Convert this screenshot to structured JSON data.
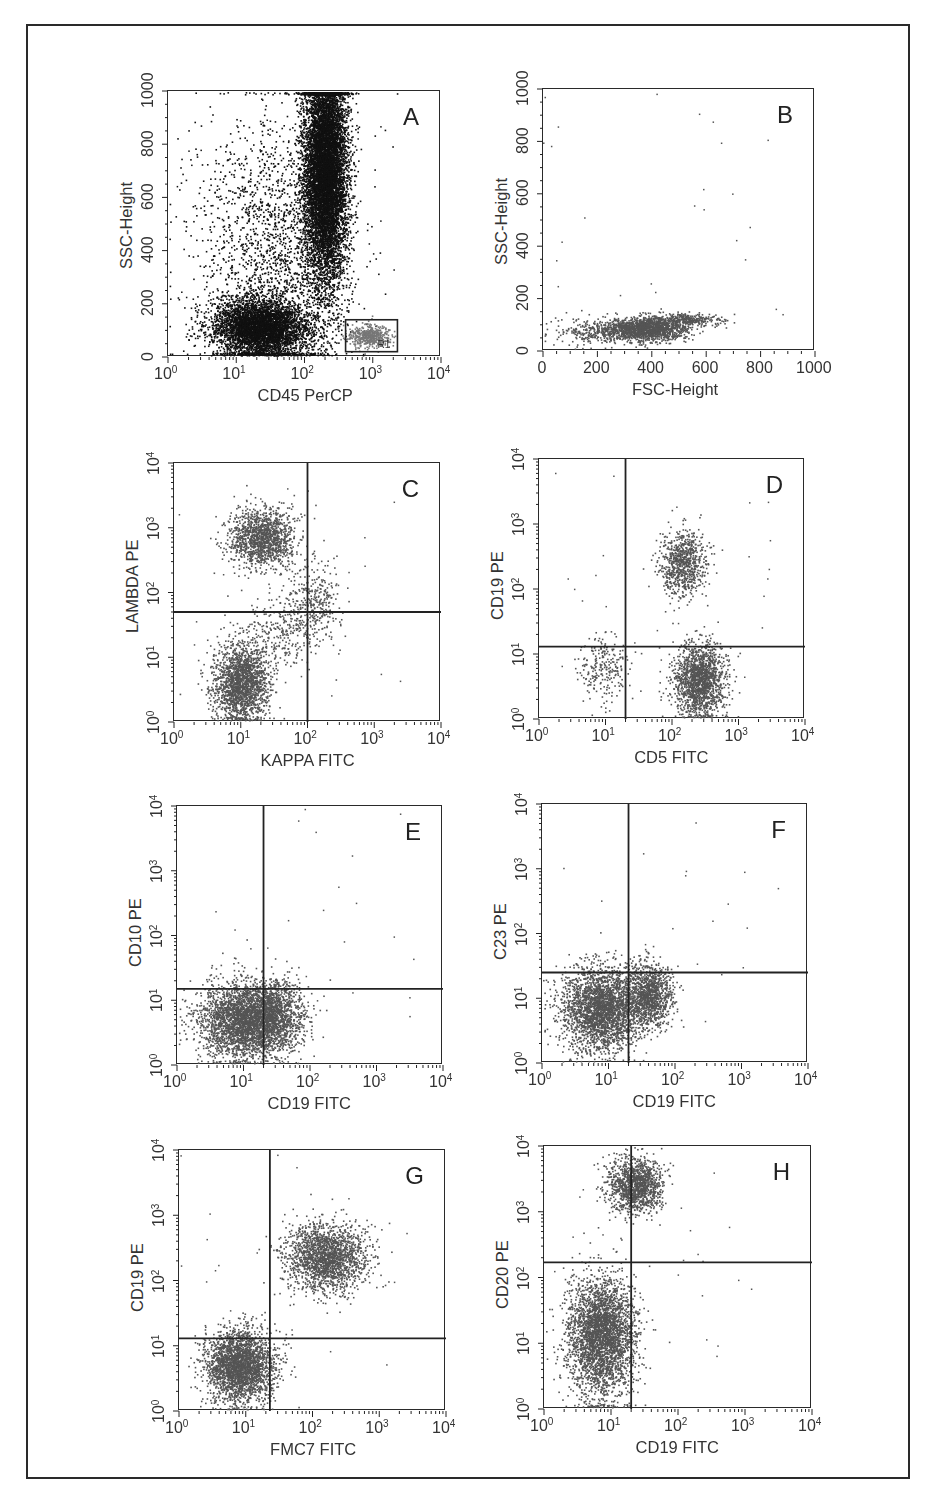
{
  "chart_data": [
    {
      "panel": "A",
      "type": "scatter",
      "xlabel": "CD45 PerCP",
      "ylabel": "SSC-Height",
      "xscale": "log",
      "xlim": [
        1,
        10000
      ],
      "xticks": [
        "10^0",
        "10^1",
        "10^2",
        "10^3",
        "10^4"
      ],
      "yscale": "linear",
      "ylim": [
        0,
        1000
      ],
      "yticks": [
        "0",
        "200",
        "400",
        "600",
        "800",
        "1000"
      ],
      "color": "#111111",
      "gate_box": {
        "label": "R1",
        "x": [
          400,
          2300
        ],
        "y": [
          20,
          140
        ]
      },
      "clusters": [
        {
          "name": "granulocytes",
          "x_log_center": 2.3,
          "x_log_sd": 0.16,
          "y_center": 700,
          "y_sd": 220,
          "n": 9000
        },
        {
          "name": "lymph/debris",
          "x_log_center": 1.35,
          "x_log_sd": 0.35,
          "y_center": 110,
          "y_sd": 55,
          "n": 4500
        },
        {
          "name": "scatter",
          "x_log_center": 1.5,
          "x_log_sd": 0.55,
          "y_center": 400,
          "y_sd": 260,
          "n": 1800
        },
        {
          "name": "R1 lymphocytes",
          "x_log_center": 2.95,
          "x_log_sd": 0.15,
          "y_center": 80,
          "y_sd": 20,
          "n": 500,
          "gray": true
        }
      ]
    },
    {
      "panel": "B",
      "type": "scatter",
      "xlabel": "FSC-Height",
      "ylabel": "SSC-Height",
      "xscale": "linear",
      "xlim": [
        0,
        1000
      ],
      "xticks": [
        "0",
        "200",
        "400",
        "600",
        "800",
        "1000"
      ],
      "yscale": "linear",
      "ylim": [
        0,
        1000
      ],
      "yticks": [
        "0",
        "200",
        "400",
        "600",
        "800",
        "1000"
      ],
      "color": "#555555",
      "clusters": [
        {
          "x_center": 380,
          "x_sd": 70,
          "y_center": 85,
          "y_sd": 22,
          "n": 1600
        },
        {
          "x_center": 520,
          "x_sd": 60,
          "y_center": 120,
          "y_sd": 12,
          "n": 350
        },
        {
          "x_center": 180,
          "x_sd": 70,
          "y_center": 75,
          "y_sd": 25,
          "n": 300
        }
      ]
    },
    {
      "panel": "C",
      "type": "scatter",
      "xlabel": "KAPPA FITC",
      "ylabel": "LAMBDA PE",
      "xscale": "log",
      "xlim": [
        1,
        10000
      ],
      "yscale": "log",
      "ylim": [
        1,
        10000
      ],
      "xticks": [
        "10^0",
        "10^1",
        "10^2",
        "10^3",
        "10^4"
      ],
      "yticks": [
        "10^0",
        "10^1",
        "10^2",
        "10^3",
        "10^4"
      ],
      "quadrant_gate": {
        "x": 100,
        "y": 50
      },
      "color": "#555555",
      "clusters": [
        {
          "x_log_center": 1.3,
          "x_log_sd": 0.25,
          "y_log_center": 2.85,
          "y_log_sd": 0.22,
          "n": 1400
        },
        {
          "x_log_center": 1.0,
          "x_log_sd": 0.2,
          "y_log_center": 0.6,
          "y_log_sd": 0.3,
          "n": 1900
        },
        {
          "x_log_center": 2.1,
          "x_log_sd": 0.2,
          "y_log_center": 1.9,
          "y_log_sd": 0.3,
          "n": 300
        },
        {
          "x_log_center": 1.6,
          "x_log_sd": 0.3,
          "y_log_center": 1.4,
          "y_log_sd": 0.3,
          "n": 300
        }
      ]
    },
    {
      "panel": "D",
      "type": "scatter",
      "xlabel": "CD5 FITC",
      "ylabel": "CD19 PE",
      "xscale": "log",
      "xlim": [
        1,
        10000
      ],
      "yscale": "log",
      "ylim": [
        1,
        10000
      ],
      "xticks": [
        "10^0",
        "10^1",
        "10^2",
        "10^3",
        "10^4"
      ],
      "yticks": [
        "10^0",
        "10^1",
        "10^2",
        "10^3",
        "10^4"
      ],
      "quadrant_gate": {
        "x": 20,
        "y": 13
      },
      "color": "#555555",
      "clusters": [
        {
          "x_log_center": 2.15,
          "x_log_sd": 0.17,
          "y_log_center": 2.4,
          "y_log_sd": 0.25,
          "n": 800
        },
        {
          "x_log_center": 2.4,
          "x_log_sd": 0.2,
          "y_log_center": 0.6,
          "y_log_sd": 0.28,
          "n": 1600
        },
        {
          "x_log_center": 1.0,
          "x_log_sd": 0.2,
          "y_log_center": 0.8,
          "y_log_sd": 0.25,
          "n": 250
        }
      ]
    },
    {
      "panel": "E",
      "type": "scatter",
      "xlabel": "CD19 FITC",
      "ylabel": "CD10 PE",
      "xscale": "log",
      "xlim": [
        1,
        10000
      ],
      "yscale": "log",
      "ylim": [
        1,
        10000
      ],
      "xticks": [
        "10^0",
        "10^1",
        "10^2",
        "10^3",
        "10^4"
      ],
      "yticks": [
        "10^0",
        "10^1",
        "10^2",
        "10^3",
        "10^4"
      ],
      "quadrant_gate": {
        "x": 20,
        "y": 15
      },
      "color": "#555555",
      "clusters": [
        {
          "x_log_center": 1.05,
          "x_log_sd": 0.35,
          "y_log_center": 0.7,
          "y_log_sd": 0.3,
          "n": 3200
        },
        {
          "x_log_center": 1.5,
          "x_log_sd": 0.2,
          "y_log_center": 0.8,
          "y_log_sd": 0.25,
          "n": 700
        }
      ]
    },
    {
      "panel": "F",
      "type": "scatter",
      "xlabel": "CD19 FITC",
      "ylabel": "C23 PE",
      "xscale": "log",
      "xlim": [
        1,
        10000
      ],
      "yscale": "log",
      "ylim": [
        1,
        10000
      ],
      "xticks": [
        "10^0",
        "10^1",
        "10^2",
        "10^3",
        "10^4"
      ],
      "yticks": [
        "10^0",
        "10^1",
        "10^2",
        "10^3",
        "10^4"
      ],
      "quadrant_gate": {
        "x": 20,
        "y": 25
      },
      "color": "#555555",
      "clusters": [
        {
          "x_log_center": 0.9,
          "x_log_sd": 0.3,
          "y_log_center": 0.85,
          "y_log_sd": 0.32,
          "n": 2800
        },
        {
          "x_log_center": 1.6,
          "x_log_sd": 0.17,
          "y_log_center": 1.05,
          "y_log_sd": 0.25,
          "n": 1100
        }
      ]
    },
    {
      "panel": "G",
      "type": "scatter",
      "xlabel": "FMC7 FITC",
      "ylabel": "CD19 PE",
      "xscale": "log",
      "xlim": [
        1,
        10000
      ],
      "yscale": "log",
      "ylim": [
        1,
        10000
      ],
      "xticks": [
        "10^0",
        "10^1",
        "10^2",
        "10^3",
        "10^4"
      ],
      "yticks": [
        "10^0",
        "10^1",
        "10^2",
        "10^3",
        "10^4"
      ],
      "quadrant_gate": {
        "x": 23,
        "y": 13
      },
      "color": "#555555",
      "clusters": [
        {
          "x_log_center": 2.2,
          "x_log_sd": 0.3,
          "y_log_center": 2.35,
          "y_log_sd": 0.25,
          "n": 1900
        },
        {
          "x_log_center": 0.9,
          "x_log_sd": 0.25,
          "y_log_center": 0.7,
          "y_log_sd": 0.28,
          "n": 2600
        }
      ]
    },
    {
      "panel": "H",
      "type": "scatter",
      "xlabel": "CD19 FITC",
      "ylabel": "CD20 PE",
      "xscale": "log",
      "xlim": [
        1,
        10000
      ],
      "yscale": "log",
      "ylim": [
        1,
        10000
      ],
      "xticks": [
        "10^0",
        "10^1",
        "10^2",
        "10^3",
        "10^4"
      ],
      "yticks": [
        "10^0",
        "10^1",
        "10^2",
        "10^3",
        "10^4"
      ],
      "quadrant_gate": {
        "x": 20,
        "y": 170
      },
      "color": "#555555",
      "clusters": [
        {
          "x_log_center": 1.35,
          "x_log_sd": 0.2,
          "y_log_center": 3.4,
          "y_log_sd": 0.2,
          "n": 1300
        },
        {
          "x_log_center": 0.85,
          "x_log_sd": 0.25,
          "y_log_center": 1.1,
          "y_log_sd": 0.45,
          "n": 3200
        }
      ]
    }
  ],
  "panels": {
    "A": {
      "letter": "A",
      "xlabel": "CD45 PerCP",
      "ylabel": "SSC-Height",
      "gate_label": "R1"
    },
    "B": {
      "letter": "B",
      "xlabel": "FSC-Height",
      "ylabel": "SSC-Height"
    },
    "C": {
      "letter": "C",
      "xlabel": "KAPPA FITC",
      "ylabel": "LAMBDA PE"
    },
    "D": {
      "letter": "D",
      "xlabel": "CD5 FITC",
      "ylabel": "CD19 PE"
    },
    "E": {
      "letter": "E",
      "xlabel": "CD19 FITC",
      "ylabel": "CD10 PE"
    },
    "F": {
      "letter": "F",
      "xlabel": "CD19 FITC",
      "ylabel": "C23 PE"
    },
    "G": {
      "letter": "G",
      "xlabel": "FMC7 FITC",
      "ylabel": "CD19 PE"
    },
    "H": {
      "letter": "H",
      "xlabel": "CD19 FITC",
      "ylabel": "CD20 PE"
    }
  },
  "layout": {
    "A": {
      "x": 167,
      "y": 90,
      "w": 273,
      "h": 266
    },
    "B": {
      "x": 542,
      "y": 88,
      "w": 272,
      "h": 262
    },
    "C": {
      "x": 173,
      "y": 462,
      "w": 267,
      "h": 259
    },
    "D": {
      "x": 538,
      "y": 458,
      "w": 266,
      "h": 260
    },
    "E": {
      "x": 176,
      "y": 805,
      "w": 266,
      "h": 259
    },
    "F": {
      "x": 541,
      "y": 803,
      "w": 266,
      "h": 259
    },
    "G": {
      "x": 178,
      "y": 1149,
      "w": 267,
      "h": 261
    },
    "H": {
      "x": 543,
      "y": 1145,
      "w": 268,
      "h": 263
    }
  }
}
